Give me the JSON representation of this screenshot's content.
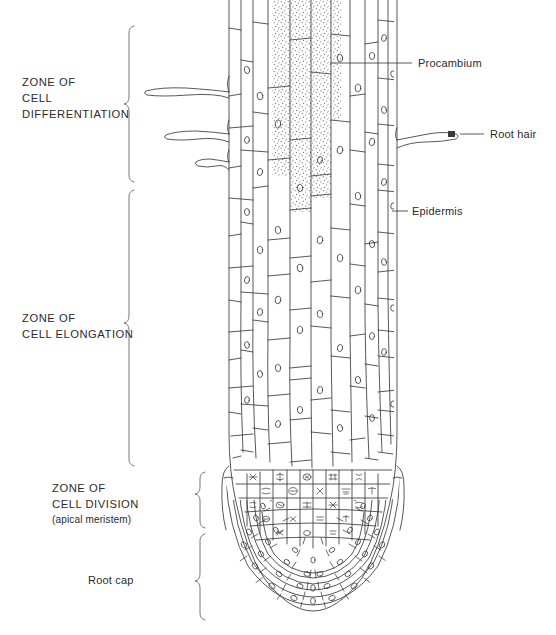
{
  "diagram": {
    "line_color": "#3a3a3a",
    "text_color": "#2b2b2b",
    "background": "#ffffff",
    "stipple_color": "#6d6d6d"
  },
  "zones": [
    {
      "id": "differentiation",
      "label_line1": "ZONE OF",
      "label_line2": "CELL",
      "label_line3": "DIFFERENTIATION",
      "sub": "",
      "bracket_top": 24,
      "bracket_bottom": 182,
      "label_x": 22,
      "label_y": 86
    },
    {
      "id": "elongation",
      "label_line1": "ZONE OF",
      "label_line2": "CELL ELONGATION",
      "label_line3": "",
      "sub": "",
      "bracket_top": 188,
      "bracket_bottom": 466,
      "label_x": 22,
      "label_y": 322
    },
    {
      "id": "division",
      "label_line1": "ZONE OF",
      "label_line2": "CELL DIVISION",
      "label_line3": "",
      "sub": "(apical meristem)",
      "bracket_top": 470,
      "bracket_bottom": 528,
      "label_x": 52,
      "label_y": 492
    },
    {
      "id": "root-cap",
      "label_line1": "Root cap",
      "label_line2": "",
      "label_line3": "",
      "sub": "",
      "bracket_top": 532,
      "bracket_bottom": 620,
      "label_x": 88,
      "label_y": 580
    }
  ],
  "callouts": [
    {
      "id": "procambium",
      "label": "Procambium",
      "text_x": 418,
      "text_y": 66,
      "leader_x1": 330,
      "leader_x2": 412,
      "leader_y": 63,
      "arrow": false
    },
    {
      "id": "root-hair",
      "label": "Root hair",
      "text_x": 490,
      "text_y": 137,
      "leader_x1": 460,
      "leader_x2": 484,
      "leader_y": 134,
      "arrow": true
    },
    {
      "id": "epidermis",
      "label": "Epidermis",
      "text_x": 412,
      "text_y": 214,
      "leader_x1": 392,
      "leader_x2": 408,
      "leader_y": 211,
      "arrow": false
    }
  ],
  "structures": {
    "root_hairs_count": 3,
    "procambium_stippled": true,
    "meristem_mitotic_figures": true,
    "root_cap_rows": 6
  }
}
